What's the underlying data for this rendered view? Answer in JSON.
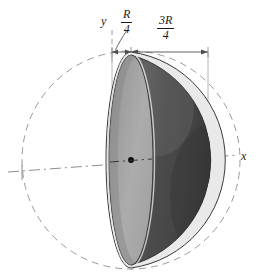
{
  "figure": {
    "type": "technical-diagram",
    "background_color": "#ffffff",
    "labels": {
      "y_axis": "y",
      "x_axis": "x",
      "dim_left_numerator": "R",
      "dim_left_denominator": "4",
      "dim_left_text": "R/4",
      "dim_right_numerator": "3R",
      "dim_right_denominator": "4",
      "dim_right_text": "3R/4"
    },
    "colors": {
      "hemisphere_surface_dark": "#4e4e4e",
      "hemisphere_surface_mid": "#5c5c5c",
      "cut_face_light": "#a9a9a9",
      "cut_face_shadow": "#8c8c8c",
      "rim_highlight": "#e8e8e8",
      "outline": "#2b2b2b",
      "axis_line": "#8a8a8a",
      "dimension_line": "#555555",
      "text": "#1a1a1a"
    },
    "geometry": {
      "sphere_center_x": 131,
      "sphere_center_y": 160,
      "sphere_radius": 109,
      "cut_plane_x": 131,
      "ellipse_semi_minor_x": 22,
      "ellipse_semi_major_y": 105,
      "centroid_dot_x": 131,
      "centroid_dot_y": 160,
      "dimension_line_y": 52,
      "extension_left_x": 112,
      "extension_mid_x": 131,
      "extension_right_x": 208
    },
    "elements": {
      "sphere_outline_style": "dashed",
      "x_axis_style": "dash-dot",
      "y_axis_style": "dashed",
      "centroid_marker": "filled-dot"
    }
  }
}
